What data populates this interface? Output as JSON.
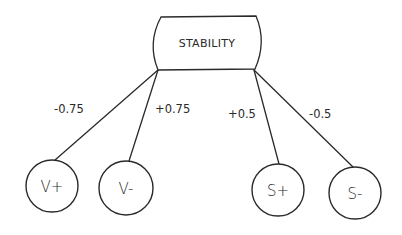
{
  "diagram": {
    "type": "tree",
    "root": {
      "label": "STABILITY",
      "shape": "rounded-barrel-box"
    },
    "edges": [
      {
        "from": "STABILITY",
        "to": "V+",
        "weight": "-0.75"
      },
      {
        "from": "STABILITY",
        "to": "V-",
        "weight": "+0.75"
      },
      {
        "from": "STABILITY",
        "to": "S+",
        "weight": "+0.5"
      },
      {
        "from": "STABILITY",
        "to": "S-",
        "weight": "-0.5"
      }
    ],
    "children": [
      {
        "label": "V+"
      },
      {
        "label": "V-"
      },
      {
        "label": "S+"
      },
      {
        "label": "S-"
      }
    ],
    "colors": {
      "stroke": "#2a2a2a",
      "background": "#ffffff"
    }
  }
}
